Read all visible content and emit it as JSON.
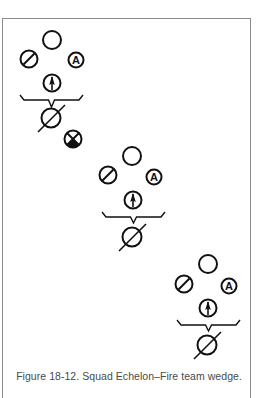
{
  "figure": {
    "caption": "Figure 18-12. Squad Echelon–Fire team wedge.",
    "title": "Squad Echelon–Fire team wedge",
    "figure_number": "18-12"
  },
  "colors": {
    "ink": "#111111",
    "frame": "#8a8a8a",
    "caption": "#4a4a4a",
    "background": "#ffffff"
  },
  "legend": {
    "plain_circle": "rifleman-icon",
    "slashed_circle": "grenadier-icon",
    "circle_a": "automatic-rifleman-icon",
    "circle_arrow": "team-leader-icon",
    "slashed_large_circle": "squad-leader-icon",
    "x_circle": "squad-element-icon",
    "letter_a": "A"
  },
  "groups": [
    {
      "name": "fire-team-1",
      "rifleman": {
        "cx": 52,
        "cy": 40
      },
      "grenadier": {
        "cx": 29,
        "cy": 59
      },
      "auto_rifleman": {
        "cx": 76,
        "cy": 60
      },
      "team_leader": {
        "cx": 52,
        "cy": 83
      },
      "bracket": {
        "x1": 20,
        "x2": 83,
        "y": 100,
        "tipY": 107
      },
      "squad_leader": {
        "cx": 51,
        "cy": 118
      },
      "extra": {
        "cx": 73,
        "cy": 139
      }
    },
    {
      "name": "fire-team-2",
      "rifleman": {
        "cx": 132,
        "cy": 156
      },
      "grenadier": {
        "cx": 108,
        "cy": 175
      },
      "auto_rifleman": {
        "cx": 154,
        "cy": 177
      },
      "team_leader": {
        "cx": 133,
        "cy": 200
      },
      "bracket": {
        "x1": 102,
        "x2": 165,
        "y": 217,
        "tipY": 223
      },
      "squad_leader": {
        "cx": 132,
        "cy": 237
      }
    },
    {
      "name": "fire-team-3",
      "rifleman": {
        "cx": 208,
        "cy": 264
      },
      "grenadier": {
        "cx": 184,
        "cy": 284
      },
      "auto_rifleman": {
        "cx": 229,
        "cy": 286
      },
      "team_leader": {
        "cx": 208,
        "cy": 308
      },
      "bracket": {
        "x1": 177,
        "x2": 240,
        "y": 325,
        "tipY": 331
      },
      "squad_leader": {
        "cx": 207,
        "cy": 345
      }
    }
  ]
}
